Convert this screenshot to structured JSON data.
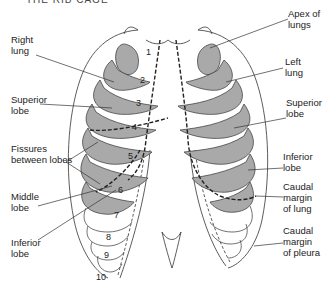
{
  "title": "THE RIB CAGE",
  "colors": {
    "lung_fill": "#a9a9a9",
    "stroke": "#333333",
    "background": "#ffffff"
  },
  "labels": {
    "right_lung": "Right\nlung",
    "superior_lobe_left": "Superior\nlobe",
    "fissures": "Fissures\nbetween lobes",
    "middle_lobe": "Middle\nlobe",
    "inferior_lobe_left": "Inferior\nlobe",
    "apex": "Apex of\nlungs",
    "left_lung": "Left\nlung",
    "superior_lobe_right": "Superior\nlobe",
    "inferior_lobe_right": "Inferior\nlobe",
    "caudal_lung": "Caudal\nmargin\nof lung",
    "caudal_pleura": "Caudal\nmargin\nof pleura"
  },
  "rib_numbers": [
    "1",
    "2",
    "3",
    "4",
    "5",
    "6",
    "7",
    "8",
    "9",
    "10"
  ]
}
